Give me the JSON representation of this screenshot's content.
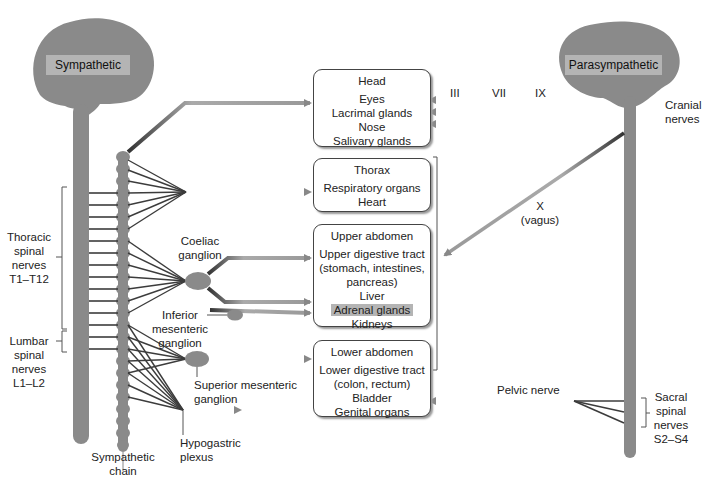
{
  "brains": {
    "sympathetic": "Sympathetic",
    "parasympathetic": "Parasympathetic"
  },
  "organ_boxes": [
    {
      "title": "Head",
      "items": [
        "Eyes",
        "Lacrimal glands",
        "Nose",
        "Salivary glands"
      ]
    },
    {
      "title": "Thorax",
      "items": [
        "Respiratory organs",
        "Heart"
      ]
    },
    {
      "title": "Upper abdomen",
      "items": [
        "Upper digestive tract",
        "(stomach, intestines,",
        "pancreas)",
        "Liver",
        "Adrenal glands",
        "Kidneys"
      ],
      "highlighted": "Adrenal glands"
    },
    {
      "title": "Lower abdomen",
      "items": [
        "Lower digestive tract",
        "(colon, rectum)",
        "Bladder",
        "Genital organs"
      ]
    }
  ],
  "left_labels": {
    "thoracic": [
      "Thoracic",
      "spinal",
      "nerves",
      "T1–T12"
    ],
    "lumbar": [
      "Lumbar",
      "spinal",
      "nerves",
      "L1–L2"
    ],
    "sympathetic_chain": [
      "Sympathetic",
      "chain"
    ]
  },
  "ganglia": {
    "coeliac": [
      "Coeliac",
      "ganglion"
    ],
    "inferior_mesenteric": [
      "Inferior",
      "mesenteric",
      "ganglion"
    ],
    "superior_mesenteric": [
      "Superior mesenteric",
      "ganglion"
    ],
    "hypogastric": [
      "Hypogastric",
      "plexus"
    ]
  },
  "cranial": {
    "nerve_numbers": [
      "III",
      "VII",
      "IX"
    ],
    "label": [
      "Cranial",
      "nerves"
    ],
    "vagus": [
      "X",
      "(vagus)"
    ]
  },
  "sacral": {
    "pelvic_nerve": "Pelvic nerve",
    "label": [
      "Sacral",
      "spinal",
      "nerves",
      "S2–S4"
    ]
  },
  "colors": {
    "brain_gray": "#8a8a8a",
    "label_gray": "#b4b4b4",
    "nerve_dark": "#3c3c3c",
    "fiber_gray": "#999999"
  }
}
